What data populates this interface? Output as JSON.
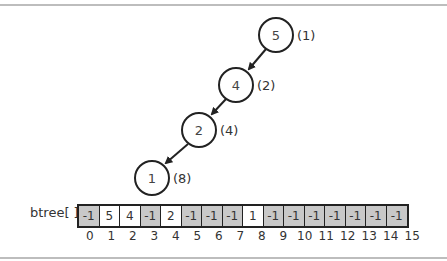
{
  "array_label": "btree[ ]",
  "nodes": [
    {
      "value": "5",
      "index_label": "(1)",
      "cx": 276,
      "cy": 35
    },
    {
      "value": "4",
      "index_label": "(2)",
      "cx": 236,
      "cy": 85
    },
    {
      "value": "2",
      "index_label": "(4)",
      "cx": 199,
      "cy": 130
    },
    {
      "value": "1",
      "index_label": "(8)",
      "cx": 152,
      "cy": 178
    }
  ],
  "array": {
    "values": [
      "-1",
      "5",
      "4",
      "-1",
      "2",
      "-1",
      "-1",
      "-1",
      "1",
      "-1",
      "-1",
      "-1",
      "-1",
      "-1",
      "-1",
      "-1"
    ],
    "indices": [
      "0",
      "1",
      "2",
      "3",
      "4",
      "5",
      "6",
      "7",
      "8",
      "9",
      "10",
      "11",
      "12",
      "13",
      "14",
      "15"
    ],
    "empty_color": "#c8c8c8",
    "filled_color": "#ffffff"
  }
}
